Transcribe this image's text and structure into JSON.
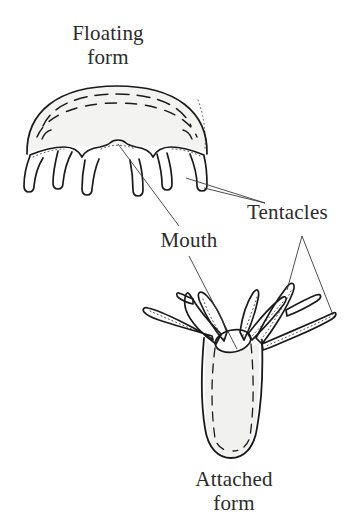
{
  "figure": {
    "title_alt": "Cnidarian life forms diagram",
    "background_color": "#ffffff",
    "ink_color": "#1a1a1a",
    "fill_color": "#f1f1ef",
    "leader_color": "#3a3a3a"
  },
  "labels": {
    "floating_form": "Floating\nform",
    "attached_form": "Attached\nform",
    "mouth": "Mouth",
    "tentacles": "Tentacles"
  },
  "organisms": {
    "medusa": {
      "name": "Floating form",
      "tentacle_count": 6,
      "features": [
        "bell",
        "dashed inner arcs",
        "mouth",
        "tentacles"
      ]
    },
    "polyp": {
      "name": "Attached form",
      "tentacle_count": 7,
      "features": [
        "column body",
        "dashed inner outline",
        "mouth",
        "tentacles"
      ]
    }
  }
}
